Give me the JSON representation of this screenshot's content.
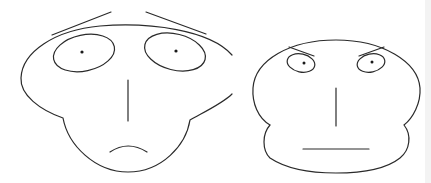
{
  "figure": {
    "stroke_color": "#2a2a2a",
    "background": "#ffffff",
    "faces": [
      {
        "name": "worried-face",
        "expression": "sad"
      },
      {
        "name": "angry-face",
        "expression": "stern"
      }
    ]
  }
}
